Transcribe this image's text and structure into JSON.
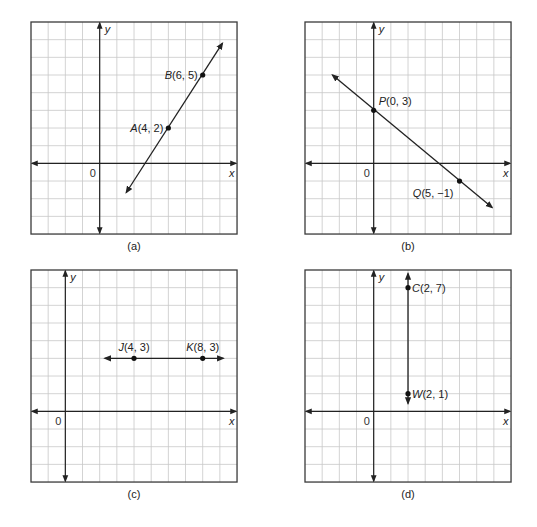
{
  "figure": {
    "panels": [
      {
        "id": "a",
        "caption": "(a)",
        "grid": {
          "left": 31,
          "top": 22,
          "cols": 12,
          "rows": 12,
          "cell_w": 17.17,
          "cell_h": 17.67
        },
        "origin_col": 4,
        "origin_row": 8,
        "axis_labels": {
          "x": "x",
          "y": "y",
          "origin": "0"
        },
        "line": {
          "type": "line",
          "from": [
            1.55,
            -1.65
          ],
          "to": [
            7.15,
            6.8
          ],
          "arrows": "both"
        },
        "points": [
          {
            "name": "A",
            "coords": "(4, 2)",
            "x": 4,
            "y": 2,
            "label_side": "left"
          },
          {
            "name": "B",
            "coords": "(6, 5)",
            "x": 6,
            "y": 5,
            "label_side": "left"
          }
        ]
      },
      {
        "id": "b",
        "caption": "(b)",
        "grid": {
          "left": 305,
          "top": 22,
          "cols": 12,
          "rows": 12,
          "cell_w": 17.17,
          "cell_h": 17.67
        },
        "origin_col": 4,
        "origin_row": 8,
        "axis_labels": {
          "x": "x",
          "y": "y",
          "origin": "0"
        },
        "line": {
          "type": "line",
          "from": [
            -2.4,
            5.0
          ],
          "to": [
            6.9,
            -2.5
          ],
          "arrows": "both"
        },
        "points": [
          {
            "name": "P",
            "coords": "(0, 3)",
            "x": 0,
            "y": 3,
            "label_side": "right-above"
          },
          {
            "name": "Q",
            "coords": "(5, −1)",
            "x": 5,
            "y": -1,
            "label_side": "left-below"
          }
        ]
      },
      {
        "id": "c",
        "caption": "(c)",
        "grid": {
          "left": 31,
          "top": 270,
          "cols": 12,
          "rows": 12,
          "cell_w": 17.17,
          "cell_h": 17.67
        },
        "origin_col": 2,
        "origin_row": 8,
        "axis_labels": {
          "x": "x",
          "y": "y",
          "origin": "0"
        },
        "line": {
          "type": "line",
          "from": [
            2.3,
            3
          ],
          "to": [
            9.2,
            3
          ],
          "arrows": "both"
        },
        "points": [
          {
            "name": "J",
            "coords": "(4, 3)",
            "x": 4,
            "y": 3,
            "label_side": "above"
          },
          {
            "name": "K",
            "coords": "(8, 3)",
            "x": 8,
            "y": 3,
            "label_side": "above"
          }
        ]
      },
      {
        "id": "d",
        "caption": "(d)",
        "grid": {
          "left": 305,
          "top": 270,
          "cols": 12,
          "rows": 12,
          "cell_w": 17.17,
          "cell_h": 17.67
        },
        "origin_col": 4,
        "origin_row": 8,
        "axis_labels": {
          "x": "x",
          "y": "y",
          "origin": "0"
        },
        "line": {
          "type": "line",
          "from": [
            2,
            0.45
          ],
          "to": [
            2,
            7.8
          ],
          "arrows": "both"
        },
        "points": [
          {
            "name": "C",
            "coords": "(2, 7)",
            "x": 2,
            "y": 7,
            "label_side": "right"
          },
          {
            "name": "W",
            "coords": "(2, 1)",
            "x": 2,
            "y": 1,
            "label_side": "right"
          }
        ]
      }
    ]
  },
  "chart_data": [
    {
      "type": "line",
      "title": "(a)",
      "xlabel": "x",
      "ylabel": "y",
      "xlim": [
        -4,
        8
      ],
      "ylim": [
        -4,
        8
      ],
      "grid": true,
      "points": [
        {
          "label": "A(4, 2)",
          "x": 4,
          "y": 2
        },
        {
          "label": "B(6, 5)",
          "x": 6,
          "y": 5
        }
      ],
      "series": [
        {
          "name": "line AB",
          "x": [
            4,
            6
          ],
          "y": [
            2,
            5
          ]
        }
      ]
    },
    {
      "type": "line",
      "title": "(b)",
      "xlabel": "x",
      "ylabel": "y",
      "xlim": [
        -4,
        8
      ],
      "ylim": [
        -4,
        8
      ],
      "grid": true,
      "points": [
        {
          "label": "P(0, 3)",
          "x": 0,
          "y": 3
        },
        {
          "label": "Q(5, −1)",
          "x": 5,
          "y": -1
        }
      ],
      "series": [
        {
          "name": "line PQ",
          "x": [
            0,
            5
          ],
          "y": [
            3,
            -1
          ]
        }
      ]
    },
    {
      "type": "line",
      "title": "(c)",
      "xlabel": "x",
      "ylabel": "y",
      "xlim": [
        -2,
        10
      ],
      "ylim": [
        -4,
        8
      ],
      "grid": true,
      "points": [
        {
          "label": "J(4, 3)",
          "x": 4,
          "y": 3
        },
        {
          "label": "K(8, 3)",
          "x": 8,
          "y": 3
        }
      ],
      "series": [
        {
          "name": "line JK",
          "x": [
            4,
            8
          ],
          "y": [
            3,
            3
          ]
        }
      ]
    },
    {
      "type": "line",
      "title": "(d)",
      "xlabel": "x",
      "ylabel": "y",
      "xlim": [
        -4,
        8
      ],
      "ylim": [
        -4,
        8
      ],
      "grid": true,
      "points": [
        {
          "label": "C(2, 7)",
          "x": 2,
          "y": 7
        },
        {
          "label": "W(2, 1)",
          "x": 2,
          "y": 1
        }
      ],
      "series": [
        {
          "name": "line CW",
          "x": [
            2,
            2
          ],
          "y": [
            7,
            1
          ]
        }
      ]
    }
  ]
}
